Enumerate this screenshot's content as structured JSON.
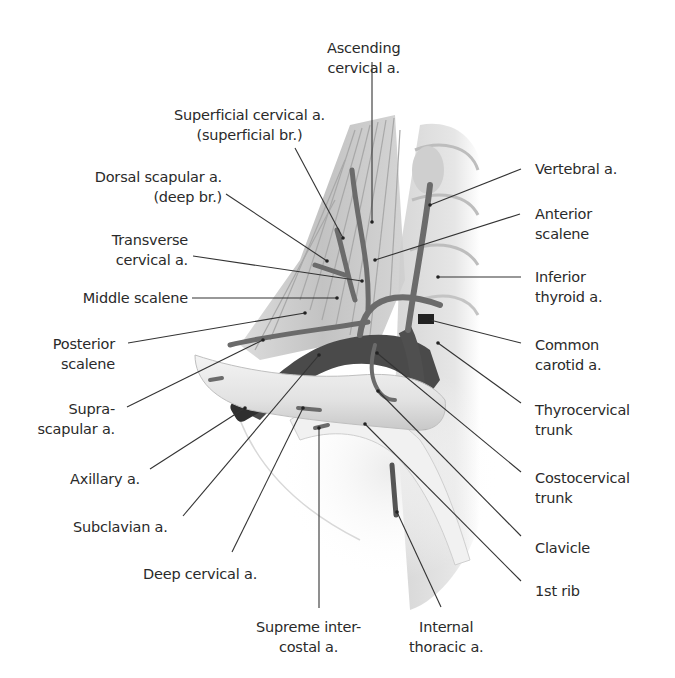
{
  "figure": {
    "background": "#ffffff",
    "line_color": "#333333",
    "artery_color": "#5c5c5c",
    "muscle_color": "#c9c9c9",
    "bone_color": "#ededed"
  },
  "labels": {
    "ascending_cervical": {
      "line1": "Ascending",
      "line2": "cervical a."
    },
    "superficial_cervical": {
      "line1": "Superficial cervical a.",
      "line2": "(superficial br.)"
    },
    "dorsal_scapular": {
      "line1": "Dorsal scapular a.",
      "line2": "(deep br.)"
    },
    "transverse_cervical": {
      "line1": "Transverse",
      "line2": "cervical a."
    },
    "middle_scalene": {
      "line1": "Middle scalene"
    },
    "posterior_scalene": {
      "line1": "Posterior",
      "line2": "scalene"
    },
    "suprascapular": {
      "line1": "Supra-",
      "line2": "scapular a."
    },
    "axillary": {
      "line1": "Axillary a."
    },
    "subclavian": {
      "line1": "Subclavian a."
    },
    "deep_cervical": {
      "line1": "Deep cervical a."
    },
    "supreme_intercostal": {
      "line1": "Supreme inter-",
      "line2": "costal a."
    },
    "internal_thoracic": {
      "line1": "Internal",
      "line2": "thoracic a."
    },
    "vertebral": {
      "line1": "Vertebral a."
    },
    "anterior_scalene": {
      "line1": "Anterior",
      "line2": "scalene"
    },
    "inferior_thyroid": {
      "line1": "Inferior",
      "line2": "thyroid a."
    },
    "common_carotid": {
      "line1": "Common",
      "line2": "carotid a."
    },
    "thyrocervical": {
      "line1": "Thyrocervical",
      "line2": "trunk"
    },
    "costocervical": {
      "line1": "Costocervical",
      "line2": "trunk"
    },
    "clavicle": {
      "line1": "Clavicle"
    },
    "first_rib": {
      "line1": "1st rib"
    }
  }
}
